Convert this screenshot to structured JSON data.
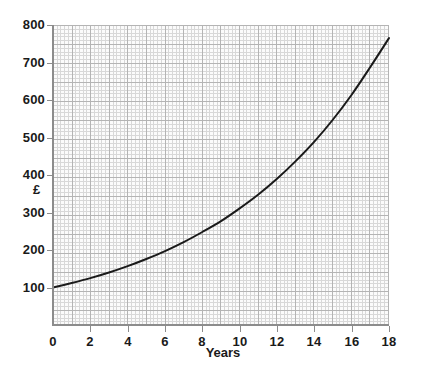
{
  "chart_data": {
    "type": "line",
    "title": "",
    "xlabel": "Years",
    "ylabel": "£",
    "xlim": [
      0,
      18
    ],
    "ylim": [
      0,
      800
    ],
    "grid": true,
    "legend": false,
    "x_ticks": [
      "0",
      "2",
      "4",
      "6",
      "8",
      "10",
      "12",
      "14",
      "16",
      "18"
    ],
    "x_tick_values": [
      0,
      2,
      4,
      6,
      8,
      10,
      12,
      14,
      16,
      18
    ],
    "y_ticks": [
      "100",
      "200",
      "300",
      "400",
      "500",
      "600",
      "700",
      "800"
    ],
    "y_tick_values": [
      100,
      200,
      300,
      400,
      500,
      600,
      700,
      800
    ],
    "series": [
      {
        "name": "Value",
        "color": "#1a1a1a",
        "x": [
          0,
          1,
          2,
          3,
          4,
          5,
          6,
          7,
          8,
          9,
          10,
          11,
          12,
          13,
          14,
          15,
          16,
          17,
          18
        ],
        "values": [
          100,
          112,
          125,
          140,
          157,
          176,
          197,
          221,
          248,
          277,
          311,
          348,
          390,
          437,
          489,
          548,
          614,
          688,
          765
        ]
      }
    ],
    "annotations": []
  },
  "axis": {
    "y_title": "£",
    "x_title": "Years"
  },
  "colors": {
    "curve": "#1a1a1a",
    "axis": "#8c8c8c",
    "grid_minor": "#d8d8d8",
    "grid_major": "#b4b4b4",
    "plot_background": "#fbfbfb",
    "text": "#1a1a1a"
  }
}
